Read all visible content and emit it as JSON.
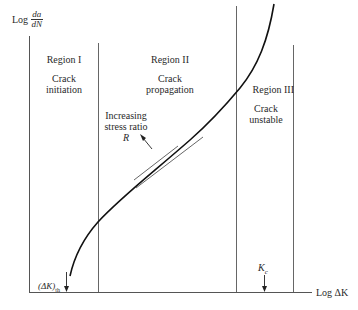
{
  "axes": {
    "y_label_prefix": "Log",
    "y_label_num": "da",
    "y_label_den": "dN",
    "x_label": "Log ΔK"
  },
  "regions": [
    {
      "title": "Region I",
      "line1": "Crack",
      "line2": "initiation"
    },
    {
      "title": "Region II",
      "line1": "Crack",
      "line2": "propagation"
    },
    {
      "title": "Region III",
      "line1": "Crack",
      "line2": "unstable"
    }
  ],
  "annotation": {
    "line1": "Increasing",
    "line2": "stress ratio",
    "symbol": "R"
  },
  "markers": {
    "threshold_main": "(ΔK)",
    "threshold_sub": "th",
    "kc_main": "K",
    "kc_sub": "c"
  },
  "colors": {
    "line": "#333333",
    "curve": "#111111",
    "text": "#2a2a2a"
  }
}
